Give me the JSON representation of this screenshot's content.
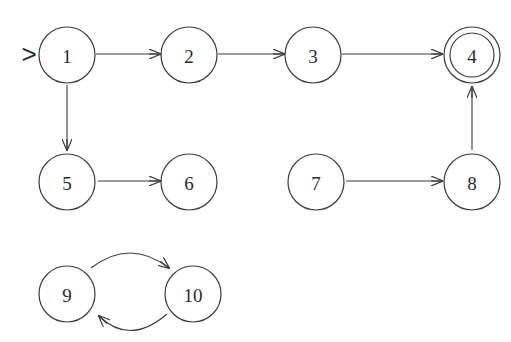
{
  "diagram": {
    "type": "finite-automaton",
    "start_marker": ">",
    "start_state": "1",
    "accepting_states": [
      "4"
    ],
    "states": [
      {
        "id": "1",
        "label": "1",
        "x": 67,
        "y": 55
      },
      {
        "id": "2",
        "label": "2",
        "x": 189,
        "y": 55
      },
      {
        "id": "3",
        "label": "3",
        "x": 313,
        "y": 55
      },
      {
        "id": "4",
        "label": "4",
        "x": 472,
        "y": 55
      },
      {
        "id": "5",
        "label": "5",
        "x": 67,
        "y": 182
      },
      {
        "id": "6",
        "label": "6",
        "x": 189,
        "y": 182
      },
      {
        "id": "7",
        "label": "7",
        "x": 316,
        "y": 182
      },
      {
        "id": "8",
        "label": "8",
        "x": 472,
        "y": 182
      },
      {
        "id": "9",
        "label": "9",
        "x": 67,
        "y": 294
      },
      {
        "id": "10",
        "label": "10",
        "x": 193,
        "y": 294
      }
    ],
    "edges": [
      {
        "from": "1",
        "to": "2"
      },
      {
        "from": "2",
        "to": "3"
      },
      {
        "from": "3",
        "to": "4"
      },
      {
        "from": "1",
        "to": "5"
      },
      {
        "from": "5",
        "to": "6"
      },
      {
        "from": "7",
        "to": "8"
      },
      {
        "from": "8",
        "to": "4"
      },
      {
        "from": "9",
        "to": "10"
      },
      {
        "from": "10",
        "to": "9"
      }
    ]
  }
}
